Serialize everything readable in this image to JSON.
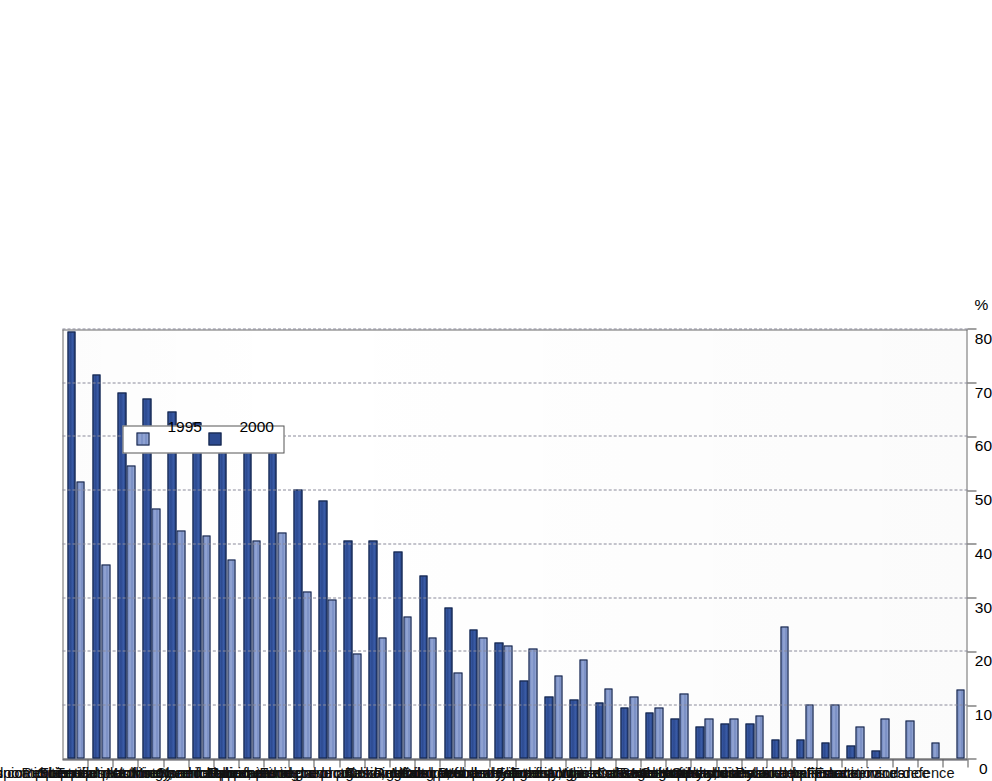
{
  "figure": {
    "unit_label": "%",
    "axis_max": 80,
    "axis_min": 0,
    "tick_step": 10,
    "colors": {
      "series_1995": "#8598cd",
      "series_2000": "#2c4a90",
      "gridline": "#8a8a9a",
      "axis": "#4a4a55",
      "background": "#ffffff"
    }
  },
  "legend": {
    "position": "upper-center",
    "entries": [
      {
        "label": "1995",
        "color": "#8598cd",
        "swatch": "s1995"
      },
      {
        "label": "2000",
        "color": "#2c4a90",
        "swatch": "s2000"
      }
    ]
  },
  "chart_data": {
    "type": "bar",
    "title": "",
    "subtitle": "",
    "xlabel": "",
    "ylabel": "%",
    "ylim": [
      0,
      80
    ],
    "yticks": [
      0,
      10,
      20,
      30,
      40,
      50,
      60,
      70,
      80
    ],
    "ytick_labels": [
      "0",
      "10",
      "20",
      "30",
      "40",
      "50",
      "60",
      "70",
      "80"
    ],
    "grid": true,
    "orientation": "vertical-bars-rotated-page",
    "legend_position": "upper-center",
    "categories": [
      "Office machinery and computers",
      "Other transport equipment",
      "Radio, TV, communication equipment",
      "Rubber and plastics",
      "Scientific instruments",
      "Electrical machinery, nec",
      "Motor vehicles",
      "Textiles, clothing and footwear",
      "Chemical products",
      "Machinery and equipment nec",
      "Manufacturing nec",
      "Non-metallic mineral products",
      "Fabricated metal products",
      "Paper, printing and publishing",
      "Basic metals",
      "Food, beverages and tobacco",
      "Wood",
      "Coke, refined petroleum",
      "Mining and quarrying",
      "Research and development",
      "Agriculture, forestry and fishing",
      "Computer and related activities",
      "Post and telecommunications",
      "Transport and storage",
      "Construction",
      "Electricity, gas and water supply",
      "Wholesale and retail trade",
      "Real estate activities",
      "Health and social work",
      "Hotels and restaurants",
      "Other business activities",
      "Renting of machinery and equipment",
      "Education",
      "Community, social and personal services",
      "Finance, insurance",
      "Public administration and defence"
    ],
    "series": [
      {
        "name": "2000",
        "color": "#2c4a90",
        "values": [
          79.5,
          71.5,
          68.0,
          67.0,
          64.5,
          62.5,
          60.0,
          59.5,
          57.0,
          50.0,
          48.0,
          40.5,
          40.5,
          38.5,
          34.0,
          28.0,
          24.0,
          21.5,
          14.5,
          11.5,
          11.0,
          10.5,
          9.5,
          8.5,
          7.5,
          6.0,
          6.5,
          6.5,
          3.5,
          3.5,
          3.0,
          2.5,
          1.5,
          0.0,
          0.0,
          0.0
        ]
      },
      {
        "name": "1995",
        "color": "#8598cd",
        "values": [
          51.5,
          36.0,
          54.5,
          46.5,
          42.5,
          41.5,
          37.0,
          40.5,
          42.0,
          31.0,
          29.5,
          19.5,
          22.5,
          26.5,
          22.5,
          16.0,
          22.5,
          21.0,
          20.5,
          15.5,
          18.5,
          13.0,
          11.5,
          9.5,
          12.0,
          7.5,
          7.5,
          8.0,
          24.5,
          10.0,
          10.0,
          6.0,
          7.5,
          7.0,
          3.0,
          12.8
        ]
      }
    ]
  }
}
